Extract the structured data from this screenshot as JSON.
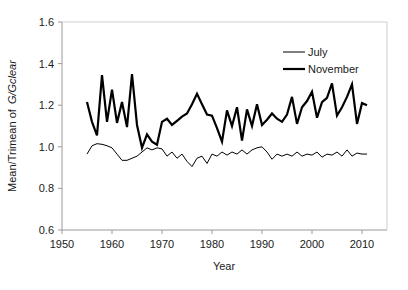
{
  "chart_data": {
    "type": "line",
    "title": "",
    "xlabel": "Year",
    "ylabel_prefix": "Mean/Trimean of ",
    "ylabel_italic": "G/Gclear",
    "xlim": [
      1950,
      2015
    ],
    "ylim": [
      0.6,
      1.6
    ],
    "xticks": [
      1950,
      1960,
      1970,
      1980,
      1990,
      2000,
      2010
    ],
    "yticks": [
      0.6,
      0.8,
      1.0,
      1.2,
      1.4,
      1.6
    ],
    "xtick_labels": [
      "1950",
      "1960",
      "1970",
      "1980",
      "1990",
      "2000",
      "2010"
    ],
    "ytick_labels": [
      "0.6",
      "0.8",
      "1.0",
      "1.2",
      "1.4",
      "1.6"
    ],
    "grid": false,
    "legend_position": "top-right",
    "line_color": "#000000",
    "axis_color": "#808080",
    "series": [
      {
        "name": "July",
        "line_width": 1,
        "x": [
          1955,
          1956,
          1957,
          1958,
          1959,
          1960,
          1961,
          1962,
          1963,
          1964,
          1965,
          1966,
          1967,
          1968,
          1969,
          1970,
          1971,
          1972,
          1973,
          1974,
          1975,
          1976,
          1977,
          1978,
          1979,
          1980,
          1981,
          1982,
          1983,
          1984,
          1985,
          1986,
          1987,
          1988,
          1989,
          1990,
          1991,
          1992,
          1993,
          1994,
          1995,
          1996,
          1997,
          1998,
          1999,
          2000,
          2001,
          2002,
          2003,
          2004,
          2005,
          2006,
          2007,
          2008,
          2009,
          2010,
          2011
        ],
        "values": [
          0.965,
          1.005,
          1.015,
          1.012,
          1.005,
          0.995,
          0.965,
          0.935,
          0.935,
          0.945,
          0.955,
          0.975,
          0.995,
          0.985,
          0.995,
          0.99,
          0.955,
          0.975,
          0.945,
          0.965,
          0.93,
          0.905,
          0.945,
          0.955,
          0.92,
          0.965,
          0.955,
          0.975,
          0.96,
          0.975,
          0.965,
          0.985,
          0.965,
          0.985,
          0.995,
          1.0,
          0.975,
          0.94,
          0.965,
          0.955,
          0.965,
          0.955,
          0.975,
          0.955,
          0.965,
          0.96,
          0.975,
          0.95,
          0.965,
          0.96,
          0.975,
          0.955,
          0.985,
          0.955,
          0.97,
          0.965,
          0.965
        ]
      },
      {
        "name": "November",
        "line_width": 2.2,
        "x": [
          1955,
          1956,
          1957,
          1958,
          1959,
          1960,
          1961,
          1962,
          1963,
          1964,
          1965,
          1966,
          1967,
          1968,
          1969,
          1970,
          1971,
          1972,
          1973,
          1974,
          1975,
          1976,
          1977,
          1978,
          1979,
          1980,
          1981,
          1982,
          1983,
          1984,
          1985,
          1986,
          1987,
          1988,
          1989,
          1990,
          1991,
          1992,
          1993,
          1994,
          1995,
          1996,
          1997,
          1998,
          1999,
          2000,
          2001,
          2002,
          2003,
          2004,
          2005,
          2006,
          2007,
          2008,
          2009,
          2010,
          2011
        ],
        "values": [
          1.215,
          1.12,
          1.055,
          1.345,
          1.12,
          1.275,
          1.115,
          1.215,
          1.095,
          1.35,
          1.105,
          0.995,
          1.06,
          1.025,
          1.01,
          1.12,
          1.135,
          1.105,
          1.125,
          1.145,
          1.16,
          1.205,
          1.255,
          1.205,
          1.155,
          1.15,
          1.09,
          1.025,
          1.175,
          1.1,
          1.19,
          1.03,
          1.18,
          1.1,
          1.205,
          1.105,
          1.13,
          1.16,
          1.135,
          1.12,
          1.155,
          1.24,
          1.11,
          1.19,
          1.22,
          1.265,
          1.14,
          1.215,
          1.235,
          1.305,
          1.15,
          1.19,
          1.24,
          1.3,
          1.11,
          1.21,
          1.2
        ]
      }
    ]
  },
  "legend": {
    "items": [
      {
        "label": "July"
      },
      {
        "label": "November"
      }
    ]
  }
}
